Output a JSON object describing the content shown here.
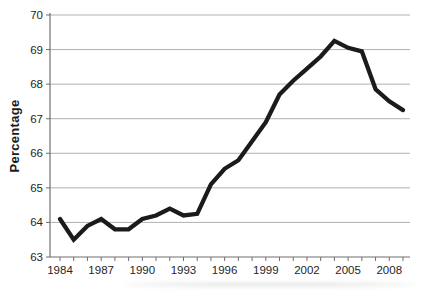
{
  "chart_data": {
    "type": "line",
    "title": "",
    "xlabel": "",
    "ylabel": "Percentage",
    "x": [
      1984,
      1985,
      1986,
      1987,
      1988,
      1989,
      1990,
      1991,
      1992,
      1993,
      1994,
      1995,
      1996,
      1997,
      1998,
      1999,
      2000,
      2001,
      2002,
      2003,
      2004,
      2005,
      2006,
      2007,
      2008,
      2009
    ],
    "series": [
      {
        "name": "Percentage",
        "values": [
          64.1,
          63.5,
          63.9,
          64.1,
          63.8,
          63.8,
          64.1,
          64.2,
          64.4,
          64.2,
          64.25,
          65.1,
          65.55,
          65.8,
          66.35,
          66.9,
          67.7,
          68.1,
          68.45,
          68.8,
          69.25,
          69.05,
          68.95,
          67.85,
          67.5,
          67.25
        ]
      }
    ],
    "ylim": [
      63,
      70
    ],
    "y_ticks": [
      63,
      64,
      65,
      66,
      67,
      68,
      69,
      70
    ],
    "x_tick_years": [
      1984,
      1987,
      1990,
      1993,
      1996,
      1999,
      2002,
      2005,
      2008
    ],
    "x_minor_tick_step": 1,
    "grid": "horizontal-only",
    "legend": "none",
    "colors": {
      "line": "#1b1b1b",
      "grid": "#b2b2b2",
      "axis": "#6e6e6e",
      "text": "#262626",
      "background": "#ffffff"
    }
  }
}
